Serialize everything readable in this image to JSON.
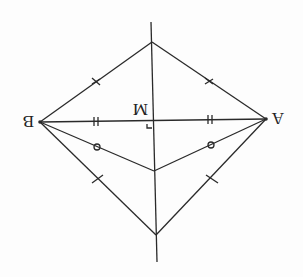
{
  "diagram": {
    "orientation": "upside-down",
    "colors": {
      "stroke": "#2a2a2a",
      "background": "#fdfdfd"
    },
    "points": {
      "A": {
        "label": "A"
      },
      "B": {
        "label": "B"
      },
      "M": {
        "label": "M"
      }
    },
    "markings": {
      "AM_BM": "double tick (equal)",
      "top_segments": "single cross (equal)",
      "middle_segments": "circle (equal)",
      "lower_segments": "single tick (equal)",
      "right_angle_at_M": true
    }
  }
}
